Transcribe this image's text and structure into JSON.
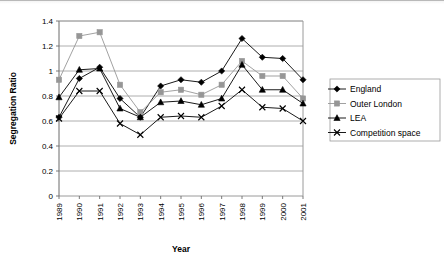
{
  "chart_data": {
    "type": "line",
    "title": "",
    "xlabel": "Year",
    "ylabel": "Segregation Ratio",
    "categories": [
      "1989",
      "1990",
      "1991",
      "1992",
      "1993",
      "1994",
      "1995",
      "1996",
      "1997",
      "1998",
      "1999",
      "2000",
      "2001"
    ],
    "x": [
      1989,
      1990,
      1991,
      1992,
      1993,
      1994,
      1995,
      1996,
      1997,
      1998,
      1999,
      2000,
      2001
    ],
    "ylim": [
      0,
      1.4
    ],
    "ytick_labels": [
      "0",
      "0.2",
      "0.4",
      "0.6",
      "0.8",
      "1",
      "1.2",
      "1.4"
    ],
    "yticks": [
      0,
      0.2,
      0.4,
      0.6,
      0.8,
      1.0,
      1.2,
      1.4
    ],
    "grid": "horizontal",
    "legend_position": "right",
    "series": [
      {
        "name": "England",
        "marker": "diamond",
        "color": "#000000",
        "values": [
          0.63,
          0.94,
          1.03,
          0.78,
          0.63,
          0.88,
          0.93,
          0.91,
          1.0,
          1.26,
          1.11,
          1.1,
          0.93
        ]
      },
      {
        "name": "Outer London",
        "marker": "square",
        "color": "#969696",
        "values": [
          0.93,
          1.28,
          1.31,
          0.89,
          0.67,
          0.83,
          0.85,
          0.81,
          0.89,
          1.08,
          0.96,
          0.96,
          0.78
        ]
      },
      {
        "name": "LEA",
        "marker": "triangle",
        "color": "#000000",
        "values": [
          0.79,
          1.01,
          1.02,
          0.7,
          0.63,
          0.75,
          0.76,
          0.73,
          0.78,
          1.05,
          0.85,
          0.85,
          0.74
        ]
      },
      {
        "name": "Competition space",
        "marker": "cross",
        "color": "#000000",
        "values": [
          0.62,
          0.84,
          0.84,
          0.58,
          0.49,
          0.63,
          0.64,
          0.63,
          0.72,
          0.85,
          0.71,
          0.7,
          0.6
        ]
      }
    ]
  },
  "legend": {
    "items": [
      {
        "label": "England"
      },
      {
        "label": "Outer London"
      },
      {
        "label": "LEA"
      },
      {
        "label": "Competition space"
      }
    ]
  }
}
